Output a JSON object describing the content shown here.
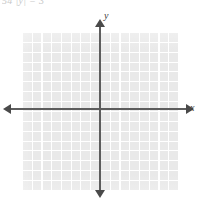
{
  "figure": {
    "type": "coordinate-grid",
    "clipped_header_text": "54  |y| = 3",
    "axes": {
      "x_label": "x",
      "y_label": "y",
      "x_axis_direction": "both",
      "y_axis_direction": "both",
      "arrowheads": [
        "left",
        "right",
        "up",
        "down"
      ]
    },
    "grid": {
      "columns": 16,
      "rows": 16,
      "cell_px": 9.8,
      "origin_col": 8,
      "origin_row": 8,
      "tick_labels": [],
      "fill_color": "#e9e9e9",
      "line_color": "#ffffff"
    },
    "colors": {
      "axis": "#5d5d5d",
      "arrow": "#4a4a4a",
      "label": "#3c3c3c",
      "background": "#ffffff"
    },
    "plotted_series": []
  },
  "chart_data": {
    "type": "scatter",
    "title": "",
    "subtitle": "",
    "xlabel": "x",
    "ylabel": "y",
    "xlim": [
      -8,
      8
    ],
    "ylim": [
      -8,
      8
    ],
    "grid": true,
    "legend": "none",
    "xticks": [],
    "yticks": [],
    "series": [],
    "annotations": [],
    "note": "Empty blank coordinate grid; no data plotted."
  }
}
